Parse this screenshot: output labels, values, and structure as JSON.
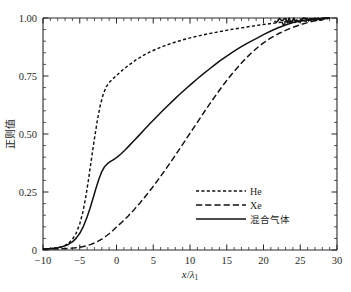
{
  "chart_data": {
    "type": "line",
    "title": "",
    "xlabel": "x/λ₁",
    "ylabel": "正则值",
    "xlim": [
      -10,
      30
    ],
    "ylim": [
      0,
      1.0
    ],
    "grid": false,
    "legend_position": "center-right-lower",
    "xticks": [
      -10,
      -5,
      0,
      5,
      10,
      15,
      20,
      25,
      30
    ],
    "xtick_labels": [
      "−10",
      "−5",
      "0",
      "5",
      "10",
      "15",
      "20",
      "25",
      "30"
    ],
    "xminor_step": 1,
    "yticks": [
      0,
      0.25,
      0.5,
      0.75,
      1.0
    ],
    "ytick_labels": [
      "0",
      "0.25",
      "0.50",
      "0.75",
      "1.00"
    ],
    "yminor_step": 0.05,
    "series": [
      {
        "name": "He",
        "style": "dotted-short-dash",
        "x": [
          -10.0,
          -9.5,
          -9.0,
          -8.5,
          -8.0,
          -7.5,
          -7.0,
          -6.5,
          -6.0,
          -5.5,
          -5.0,
          -4.6,
          -4.2,
          -3.8,
          -3.4,
          -3.0,
          -2.6,
          -2.2,
          -1.8,
          -1.4,
          -1.0,
          -0.5,
          0.0,
          0.8,
          1.6,
          2.5,
          3.5,
          4.5,
          5.5,
          6.5,
          7.5,
          8.5,
          9.5,
          10.5,
          11.5,
          12.5,
          13.5,
          14.5,
          15.5,
          16.5,
          17.5,
          18.5,
          19.5,
          20.5,
          21.5,
          22.5,
          23.5,
          24.5,
          25.5,
          26.5,
          27.5,
          28.5,
          29.0
        ],
        "y": [
          0.004,
          0.005,
          0.006,
          0.008,
          0.01,
          0.014,
          0.02,
          0.03,
          0.046,
          0.072,
          0.112,
          0.16,
          0.225,
          0.305,
          0.395,
          0.48,
          0.56,
          0.625,
          0.672,
          0.703,
          0.722,
          0.738,
          0.752,
          0.775,
          0.795,
          0.816,
          0.836,
          0.853,
          0.867,
          0.88,
          0.891,
          0.901,
          0.91,
          0.918,
          0.925,
          0.932,
          0.938,
          0.944,
          0.95,
          0.955,
          0.96,
          0.965,
          0.97,
          0.974,
          0.978,
          0.982,
          0.986,
          0.989,
          0.992,
          0.995,
          0.997,
          0.999,
          1.0
        ]
      },
      {
        "name": "Xe",
        "style": "long-dash",
        "x": [
          -10.0,
          -9.0,
          -8.0,
          -7.0,
          -6.0,
          -5.5,
          -5.0,
          -4.5,
          -4.0,
          -3.5,
          -3.0,
          -2.5,
          -2.0,
          -1.5,
          -1.0,
          -0.5,
          0.0,
          0.8,
          1.6,
          2.4,
          3.2,
          4.0,
          4.8,
          5.6,
          6.4,
          7.2,
          8.0,
          8.8,
          9.6,
          10.4,
          11.2,
          12.0,
          12.8,
          13.6,
          14.4,
          15.2,
          16.0,
          16.8,
          17.6,
          18.4,
          19.2,
          20.0,
          21.0,
          22.0,
          23.0,
          24.0,
          25.0,
          26.0,
          27.0,
          28.0,
          29.0
        ],
        "y": [
          0.003,
          0.004,
          0.005,
          0.006,
          0.008,
          0.01,
          0.012,
          0.015,
          0.019,
          0.024,
          0.03,
          0.038,
          0.047,
          0.058,
          0.07,
          0.084,
          0.099,
          0.122,
          0.147,
          0.174,
          0.203,
          0.234,
          0.266,
          0.3,
          0.335,
          0.371,
          0.408,
          0.446,
          0.484,
          0.522,
          0.56,
          0.598,
          0.635,
          0.671,
          0.706,
          0.739,
          0.77,
          0.799,
          0.826,
          0.851,
          0.873,
          0.893,
          0.914,
          0.932,
          0.947,
          0.96,
          0.971,
          0.98,
          0.988,
          0.994,
          1.0
        ]
      },
      {
        "name": "混合气体",
        "style": "solid",
        "x": [
          -10.0,
          -9.0,
          -8.5,
          -8.0,
          -7.5,
          -7.0,
          -6.5,
          -6.0,
          -5.5,
          -5.0,
          -4.5,
          -4.0,
          -3.6,
          -3.2,
          -2.8,
          -2.4,
          -2.0,
          -1.6,
          -1.2,
          -0.8,
          -0.4,
          0.0,
          0.6,
          1.2,
          1.8,
          2.4,
          3.0,
          3.8,
          4.6,
          5.4,
          6.2,
          7.0,
          7.8,
          8.6,
          9.4,
          10.2,
          11.0,
          11.8,
          12.6,
          13.4,
          14.2,
          15.0,
          15.8,
          16.6,
          17.4,
          18.2,
          19.0,
          20.0,
          21.0,
          22.0,
          23.0,
          24.0,
          25.0,
          26.0,
          27.0,
          28.0,
          29.0
        ],
        "y": [
          0.004,
          0.006,
          0.008,
          0.01,
          0.013,
          0.018,
          0.025,
          0.035,
          0.05,
          0.072,
          0.102,
          0.142,
          0.18,
          0.222,
          0.265,
          0.305,
          0.338,
          0.36,
          0.373,
          0.382,
          0.39,
          0.398,
          0.414,
          0.432,
          0.452,
          0.472,
          0.492,
          0.519,
          0.546,
          0.572,
          0.598,
          0.623,
          0.647,
          0.671,
          0.694,
          0.716,
          0.738,
          0.759,
          0.779,
          0.799,
          0.818,
          0.836,
          0.853,
          0.869,
          0.884,
          0.898,
          0.911,
          0.928,
          0.944,
          0.958,
          0.97,
          0.98,
          0.988,
          0.993,
          0.996,
          0.998,
          1.0
        ]
      }
    ],
    "legend": [
      {
        "label": "He",
        "style": "dotted-short-dash"
      },
      {
        "label": "Xe",
        "style": "long-dash"
      },
      {
        "label": "混合气体",
        "style": "solid"
      }
    ],
    "colors": {
      "curve": "#111111",
      "axis": "#2b2b2b",
      "background": "#ffffff",
      "text": "#1f1f1f"
    }
  }
}
